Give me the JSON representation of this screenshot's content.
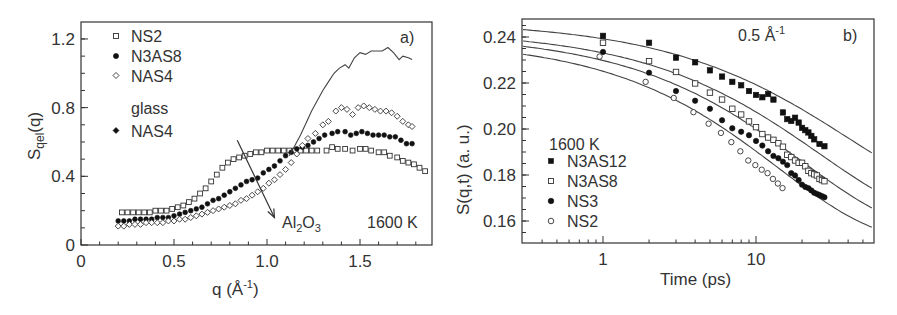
{
  "chart_data": [
    {
      "type": "scatter",
      "panel_label": "a)",
      "title": "",
      "xlabel": "q  (Å⁻¹)",
      "ylabel": "S_qel(q)",
      "xlim": [
        0,
        1.887
      ],
      "ylim": [
        0,
        1.3
      ],
      "xticks": [
        0,
        0.5,
        1.0,
        1.5
      ],
      "xtick_labels": [
        "0",
        "0.5",
        "1.0",
        "1.5"
      ],
      "yticks": [
        0,
        0.4,
        0.8,
        1.2
      ],
      "ytick_labels": [
        "0",
        "0.4",
        "0.8",
        "1.2"
      ],
      "grid": false,
      "legend_position": "upper-left",
      "legend_entries": [
        "NS2",
        "N3AS8",
        "NAS4",
        "glass",
        "NAS4"
      ],
      "annotations": [
        "Al2O3",
        "1600 K",
        "a)"
      ],
      "series": [
        {
          "name": "NS2",
          "marker": "open-square",
          "x": [
            0.22,
            0.25,
            0.28,
            0.31,
            0.34,
            0.37,
            0.4,
            0.43,
            0.46,
            0.49,
            0.52,
            0.55,
            0.58,
            0.61,
            0.64,
            0.67,
            0.7,
            0.73,
            0.76,
            0.79,
            0.82,
            0.85,
            0.88,
            0.91,
            0.94,
            0.97,
            1.0,
            1.03,
            1.06,
            1.09,
            1.12,
            1.15,
            1.18,
            1.21,
            1.24,
            1.27,
            1.32,
            1.35,
            1.38,
            1.42,
            1.46,
            1.5,
            1.53,
            1.56,
            1.6,
            1.63,
            1.66,
            1.7,
            1.73,
            1.76,
            1.79,
            1.82,
            1.85
          ],
          "y": [
            0.19,
            0.19,
            0.19,
            0.19,
            0.19,
            0.19,
            0.2,
            0.2,
            0.2,
            0.21,
            0.22,
            0.23,
            0.25,
            0.27,
            0.3,
            0.33,
            0.37,
            0.41,
            0.45,
            0.48,
            0.5,
            0.51,
            0.52,
            0.53,
            0.54,
            0.54,
            0.55,
            0.55,
            0.55,
            0.55,
            0.55,
            0.55,
            0.55,
            0.55,
            0.55,
            0.55,
            0.55,
            0.57,
            0.56,
            0.56,
            0.55,
            0.56,
            0.56,
            0.55,
            0.54,
            0.54,
            0.52,
            0.51,
            0.49,
            0.48,
            0.47,
            0.45,
            0.43
          ]
        },
        {
          "name": "N3AS8",
          "marker": "filled-circle",
          "x": [
            0.2,
            0.23,
            0.26,
            0.29,
            0.32,
            0.35,
            0.38,
            0.41,
            0.44,
            0.47,
            0.5,
            0.53,
            0.56,
            0.59,
            0.62,
            0.65,
            0.68,
            0.71,
            0.74,
            0.77,
            0.8,
            0.83,
            0.86,
            0.89,
            0.92,
            0.95,
            0.98,
            1.01,
            1.04,
            1.07,
            1.1,
            1.13,
            1.16,
            1.19,
            1.22,
            1.25,
            1.28,
            1.31,
            1.35,
            1.38,
            1.42,
            1.45,
            1.48,
            1.51,
            1.54,
            1.57,
            1.6,
            1.63,
            1.66,
            1.69,
            1.72,
            1.75,
            1.78
          ],
          "y": [
            0.14,
            0.14,
            0.14,
            0.15,
            0.15,
            0.15,
            0.15,
            0.16,
            0.16,
            0.16,
            0.17,
            0.18,
            0.19,
            0.2,
            0.21,
            0.22,
            0.24,
            0.26,
            0.27,
            0.29,
            0.31,
            0.33,
            0.35,
            0.37,
            0.38,
            0.39,
            0.42,
            0.44,
            0.46,
            0.49,
            0.52,
            0.54,
            0.56,
            0.57,
            0.58,
            0.6,
            0.62,
            0.64,
            0.65,
            0.66,
            0.66,
            0.64,
            0.65,
            0.66,
            0.65,
            0.64,
            0.64,
            0.64,
            0.63,
            0.63,
            0.61,
            0.59,
            0.59
          ]
        },
        {
          "name": "NAS4",
          "marker": "open-diamond",
          "x": [
            0.2,
            0.23,
            0.26,
            0.29,
            0.32,
            0.35,
            0.38,
            0.41,
            0.44,
            0.47,
            0.5,
            0.53,
            0.56,
            0.59,
            0.62,
            0.65,
            0.68,
            0.71,
            0.74,
            0.77,
            0.8,
            0.83,
            0.86,
            0.89,
            0.92,
            0.95,
            0.98,
            1.01,
            1.04,
            1.07,
            1.1,
            1.13,
            1.16,
            1.19,
            1.22,
            1.26,
            1.3,
            1.33,
            1.37,
            1.4,
            1.43,
            1.46,
            1.49,
            1.52,
            1.55,
            1.58,
            1.61,
            1.64,
            1.67,
            1.7,
            1.73,
            1.76,
            1.78
          ],
          "y": [
            0.11,
            0.11,
            0.12,
            0.12,
            0.12,
            0.13,
            0.13,
            0.13,
            0.13,
            0.14,
            0.14,
            0.15,
            0.15,
            0.16,
            0.17,
            0.18,
            0.19,
            0.2,
            0.21,
            0.22,
            0.23,
            0.24,
            0.26,
            0.27,
            0.29,
            0.31,
            0.33,
            0.36,
            0.38,
            0.41,
            0.44,
            0.48,
            0.53,
            0.58,
            0.62,
            0.65,
            0.7,
            0.72,
            0.78,
            0.8,
            0.79,
            0.76,
            0.8,
            0.81,
            0.8,
            0.79,
            0.78,
            0.78,
            0.77,
            0.75,
            0.72,
            0.7,
            0.69
          ]
        },
        {
          "name": "glass NAS4",
          "marker": "line",
          "x": [
            1.12,
            1.15,
            1.18,
            1.21,
            1.24,
            1.27,
            1.3,
            1.33,
            1.36,
            1.39,
            1.42,
            1.44,
            1.47,
            1.5,
            1.53,
            1.56,
            1.59,
            1.62,
            1.65,
            1.68,
            1.71,
            1.73,
            1.76,
            1.78
          ],
          "y": [
            0.52,
            0.58,
            0.64,
            0.71,
            0.78,
            0.84,
            0.9,
            0.95,
            1.0,
            1.03,
            1.05,
            1.03,
            1.09,
            1.12,
            1.11,
            1.13,
            1.13,
            1.13,
            1.15,
            1.12,
            1.08,
            1.1,
            1.09,
            1.08
          ]
        }
      ],
      "arrow": {
        "from": [
          0.84,
          0.61
        ],
        "to": [
          1.04,
          0.16
        ],
        "label": "Al2O3"
      }
    },
    {
      "type": "scatter",
      "panel_label": "b)",
      "title": "",
      "xlabel": "Time  (ps)",
      "ylabel": "S(q,t)  (a. u.)",
      "xscale": "log",
      "xlim": [
        0.3,
        59
      ],
      "ylim": [
        0.1503,
        0.2478
      ],
      "xticks": [
        1,
        10
      ],
      "xtick_labels": [
        "1",
        "10"
      ],
      "yticks": [
        0.16,
        0.18,
        0.2,
        0.22,
        0.24
      ],
      "ytick_labels": [
        "0.16",
        "0.18",
        "0.20",
        "0.22",
        "0.24"
      ],
      "grid": false,
      "legend_title": "1600 K",
      "legend_position": "lower-left",
      "legend_entries": [
        "N3AS12",
        "N3AS8",
        "NS3",
        "NS2"
      ],
      "annotations": [
        "0.5 Å⁻¹",
        "b)"
      ],
      "series": [
        {
          "name": "N3AS12",
          "marker": "filled-square",
          "fit": {
            "A": 0.0805,
            "tau": 40,
            "beta": 0.62,
            "base": 0.1665
          },
          "x": [
            1,
            2,
            3,
            4,
            5,
            6,
            7,
            8,
            9,
            10,
            11,
            12,
            13,
            15,
            16,
            17,
            18,
            19,
            20,
            21,
            22,
            23,
            24,
            26,
            28
          ],
          "y": [
            0.2405,
            0.2375,
            0.231,
            0.229,
            0.2255,
            0.2228,
            0.2205,
            0.219,
            0.2165,
            0.2148,
            0.2138,
            0.2152,
            0.2128,
            0.2072,
            0.2043,
            0.2035,
            0.2049,
            0.2028,
            0.2005,
            0.1995,
            0.1985,
            0.197,
            0.1955,
            0.1935,
            0.1925
          ]
        },
        {
          "name": "N3AS8",
          "marker": "open-square",
          "fit": {
            "A": 0.085,
            "tau": 26,
            "beta": 0.64,
            "base": 0.158
          },
          "x": [
            1,
            2,
            3,
            4,
            5,
            6,
            7,
            8,
            9,
            10,
            11,
            12,
            13,
            14,
            15,
            16,
            17,
            18,
            19,
            20,
            21,
            22,
            23,
            24,
            25,
            26,
            27,
            28
          ],
          "y": [
            0.2375,
            0.2295,
            0.2248,
            0.2198,
            0.2158,
            0.2128,
            0.2088,
            0.2063,
            0.2033,
            0.2008,
            0.1978,
            0.1963,
            0.1953,
            0.1938,
            0.1923,
            0.1888,
            0.1878,
            0.1863,
            0.1853,
            0.1853,
            0.1838,
            0.1818,
            0.1808,
            0.1803,
            0.1798,
            0.1783,
            0.1778,
            0.1773
          ]
        },
        {
          "name": "NS3",
          "marker": "filled-circle",
          "fit": {
            "A": 0.088,
            "tau": 20,
            "beta": 0.65,
            "base": 0.1535
          },
          "x": [
            1,
            2,
            3,
            4,
            5,
            6,
            7,
            8,
            9,
            10,
            11,
            12,
            13,
            14,
            15,
            16,
            17,
            18,
            19,
            20,
            21,
            22,
            23,
            24,
            25,
            26,
            27,
            28
          ],
          "y": [
            0.2335,
            0.2245,
            0.2165,
            0.2123,
            0.2088,
            0.2038,
            0.2003,
            0.1988,
            0.1973,
            0.1948,
            0.1928,
            0.1903,
            0.1883,
            0.1873,
            0.1858,
            0.1843,
            0.1808,
            0.1798,
            0.1778,
            0.1758,
            0.1748,
            0.1743,
            0.1733,
            0.1723,
            0.1718,
            0.1713,
            0.1708,
            0.1703
          ]
        },
        {
          "name": "NS2",
          "marker": "open-circle",
          "fit": {
            "A": 0.0885,
            "tau": 14,
            "beta": 0.67,
            "base": 0.1505
          },
          "x": [
            0.95,
            1.9,
            2.9,
            3.9,
            4.9,
            5.9,
            6.9,
            7.9,
            8.9,
            9.9,
            10.9,
            11.9,
            12.9,
            13.9,
            14.9
          ],
          "y": [
            0.2315,
            0.2205,
            0.2135,
            0.2073,
            0.2023,
            0.1983,
            0.1943,
            0.1903,
            0.1863,
            0.1843,
            0.1823,
            0.1808,
            0.1783,
            0.1763,
            0.1743
          ]
        }
      ]
    }
  ],
  "panel_a": {
    "ylabel_main": "S",
    "ylabel_sub": "qel",
    "ylabel_tail": "(q)",
    "xlabel_main": "q  (",
    "xlabel_unit": "Å",
    "xlabel_exp": "-1",
    "xlabel_close": ")",
    "panel_label": "a)",
    "temp_label": "1600 K",
    "arrow_label_main": "Al",
    "arrow_label_sub1": "2",
    "arrow_label_mid": "O",
    "arrow_label_sub2": "3",
    "legend": [
      {
        "label": "NS2",
        "marker": "open-square"
      },
      {
        "label": "N3AS8",
        "marker": "filled-circle"
      },
      {
        "label": "NAS4",
        "marker": "open-diamond"
      },
      {
        "label": "glass",
        "marker": "none"
      },
      {
        "label": "NAS4",
        "marker": "filled-diamond"
      }
    ]
  },
  "panel_b": {
    "ylabel": "S(q,t)  (a. u.)",
    "xlabel": "Time  (ps)",
    "panel_label": "b)",
    "q_label_main": "0.5 ",
    "q_label_unit": "Å",
    "q_label_exp": "-1",
    "legend_title": "1600 K",
    "legend": [
      {
        "label": "N3AS12",
        "marker": "filled-square"
      },
      {
        "label": "N3AS8",
        "marker": "open-square"
      },
      {
        "label": "NS3",
        "marker": "filled-circle"
      },
      {
        "label": "NS2",
        "marker": "open-circle"
      }
    ]
  }
}
